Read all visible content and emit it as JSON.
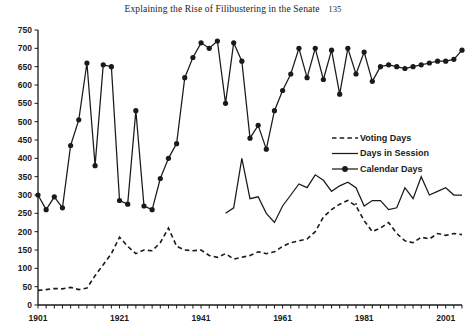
{
  "page": {
    "running_head": "Explaining the Rise of Filibustering in the Senate",
    "folio": "135"
  },
  "chart_data": {
    "type": "line",
    "title": "",
    "xlabel": "",
    "ylabel": "",
    "xlim": [
      1901,
      2005
    ],
    "ylim": [
      0,
      750
    ],
    "ytick_step": 50,
    "ytick_labels": [
      "0",
      "50",
      "100",
      "150",
      "200",
      "250",
      "300",
      "350",
      "400",
      "450",
      "500",
      "550",
      "600",
      "650",
      "700",
      "750"
    ],
    "xtick_labels": [
      "1901",
      "1921",
      "1941",
      "1961",
      "1981",
      "2001"
    ],
    "xtick_values": [
      1901,
      1921,
      1941,
      1961,
      1981,
      2001
    ],
    "xtick_minor_step": 2,
    "grid": false,
    "legend_position": "right-middle",
    "legend": [
      "Voting Days",
      "Days in Session",
      "Calendar Days"
    ],
    "series": [
      {
        "name": "Voting Days",
        "style": "dashed",
        "x": [
          1901,
          1903,
          1905,
          1907,
          1909,
          1911,
          1913,
          1915,
          1917,
          1919,
          1921,
          1923,
          1925,
          1927,
          1929,
          1931,
          1933,
          1935,
          1937,
          1939,
          1941,
          1943,
          1945,
          1947,
          1949,
          1951,
          1953,
          1955,
          1957,
          1959,
          1961,
          1963,
          1965,
          1967,
          1969,
          1971,
          1973,
          1975,
          1977,
          1979,
          1981,
          1983,
          1985,
          1987,
          1989,
          1991,
          1993,
          1995,
          1997,
          1999,
          2001,
          2003,
          2005
        ],
        "values": [
          40,
          42,
          45,
          44,
          48,
          42,
          46,
          80,
          110,
          140,
          185,
          160,
          140,
          150,
          148,
          170,
          210,
          160,
          150,
          148,
          150,
          135,
          130,
          140,
          125,
          130,
          135,
          145,
          140,
          145,
          160,
          170,
          175,
          180,
          200,
          240,
          260,
          275,
          285,
          270,
          230,
          200,
          210,
          225,
          195,
          175,
          170,
          185,
          180,
          195,
          190,
          195,
          192
        ]
      },
      {
        "name": "Days in Session",
        "style": "solid",
        "x": [
          1947,
          1949,
          1951,
          1953,
          1955,
          1957,
          1959,
          1961,
          1963,
          1965,
          1967,
          1969,
          1971,
          1973,
          1975,
          1977,
          1979,
          1981,
          1983,
          1985,
          1987,
          1989,
          1991,
          1993,
          1995,
          1997,
          1999,
          2001,
          2003,
          2005
        ],
        "values": [
          250,
          265,
          400,
          290,
          295,
          250,
          225,
          270,
          300,
          330,
          320,
          355,
          340,
          310,
          325,
          335,
          320,
          270,
          285,
          285,
          260,
          265,
          320,
          290,
          350,
          300,
          310,
          320,
          300,
          300
        ]
      },
      {
        "name": "Calendar Days",
        "style": "solid-markers",
        "x": [
          1901,
          1903,
          1905,
          1907,
          1909,
          1911,
          1913,
          1915,
          1917,
          1919,
          1921,
          1923,
          1925,
          1927,
          1929,
          1931,
          1933,
          1935,
          1937,
          1939,
          1941,
          1943,
          1945,
          1947,
          1949,
          1951,
          1953,
          1955,
          1957,
          1959,
          1961,
          1963,
          1965,
          1967,
          1969,
          1971,
          1973,
          1975,
          1977,
          1979,
          1981,
          1983,
          1985,
          1987,
          1989,
          1991,
          1993,
          1995,
          1997,
          1999,
          2001,
          2003,
          2005
        ],
        "values": [
          300,
          260,
          295,
          265,
          435,
          505,
          660,
          380,
          655,
          650,
          285,
          275,
          530,
          270,
          260,
          345,
          400,
          440,
          620,
          675,
          715,
          700,
          720,
          550,
          715,
          665,
          455,
          490,
          425,
          530,
          585,
          630,
          700,
          620,
          700,
          615,
          695,
          575,
          700,
          630,
          690,
          610,
          650,
          655,
          650,
          645,
          650,
          655,
          660,
          665,
          665,
          670,
          695
        ]
      }
    ]
  }
}
